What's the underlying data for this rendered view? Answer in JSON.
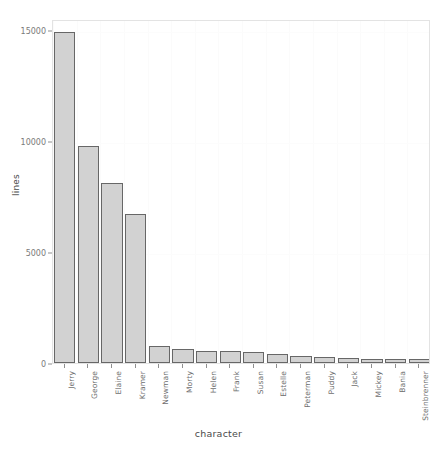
{
  "chart_data": {
    "type": "bar",
    "title": "",
    "xlabel": "character",
    "ylabel": "lines",
    "categories": [
      "Jerry",
      "George",
      "Elaine",
      "Kramer",
      "Newman",
      "Morty",
      "Helen",
      "Frank",
      "Susan",
      "Estelle",
      "Peterman",
      "Puddy",
      "Jack",
      "Mickey",
      "Bania",
      "Steinbrenner"
    ],
    "values": [
      14900,
      9800,
      8100,
      6700,
      750,
      610,
      560,
      530,
      480,
      400,
      300,
      250,
      220,
      200,
      190,
      185
    ],
    "ylim": [
      0,
      15500
    ],
    "yticks": [
      0,
      5000,
      10000,
      15000
    ],
    "ytick_labels": [
      "0",
      "5000",
      "10000",
      "15000"
    ],
    "grid": "vertical-minor-faint",
    "legend": "none",
    "bar_fill": "#d2d2d2",
    "bar_border": "#676767",
    "panel_border": "#e3e3e3",
    "background": "#ffffff"
  }
}
